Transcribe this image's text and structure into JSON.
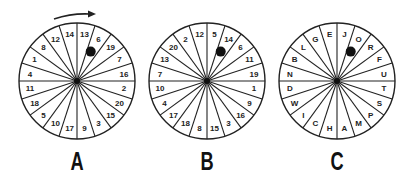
{
  "diagram": {
    "rotation_arrow": "clockwise",
    "wheels": [
      {
        "label": "A",
        "sectors_clockwise_from_top": [
          "13",
          "6",
          "19",
          "7",
          "16",
          "2",
          "20",
          "15",
          "3",
          "9",
          "17",
          "10",
          "5",
          "18",
          "11",
          "4",
          "1",
          "8",
          "12",
          "14"
        ],
        "dot_sector": "6"
      },
      {
        "label": "B",
        "sectors_clockwise_from_top": [
          "5",
          "14",
          "6",
          "11",
          "19",
          "1",
          "9",
          "16",
          "3",
          "15",
          "8",
          "18",
          "17",
          "4",
          "10",
          "7",
          "13",
          "20",
          "2",
          "12"
        ],
        "dot_sector": "14"
      },
      {
        "label": "C",
        "sectors_clockwise_from_top": [
          "J",
          "O",
          "R",
          "F",
          "U",
          "T",
          "S",
          "P",
          "M",
          "A",
          "H",
          "C",
          "I",
          "W",
          "D",
          "N",
          "B",
          "L",
          "G",
          "E"
        ],
        "dot_sector": "O"
      }
    ],
    "colors": {
      "line": "#222222",
      "dot": "#111111",
      "background": "#ffffff"
    }
  }
}
